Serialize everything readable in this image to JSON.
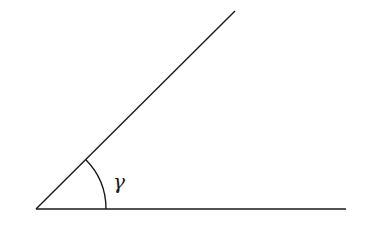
{
  "diagram": {
    "type": "angle",
    "colors": {
      "background": "#ffffff",
      "stroke": "#1a1a1a"
    },
    "vertex": {
      "x": 36,
      "y": 209
    },
    "rays": [
      {
        "name": "base-ray",
        "x2": 346,
        "y2": 209
      },
      {
        "name": "inclined-ray",
        "x2": 235,
        "y2": 11
      }
    ],
    "arc": {
      "radius": 70
    },
    "angle_label": "γ"
  }
}
